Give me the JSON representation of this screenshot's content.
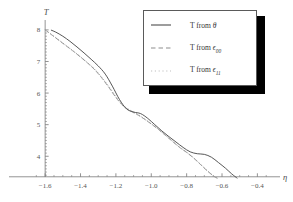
{
  "chart_data": {
    "type": "line",
    "title": "",
    "xlabel": "η",
    "ylabel": "T",
    "xlim": [
      -1.68,
      -0.34
    ],
    "ylim": [
      3.28,
      8.25
    ],
    "grid": false,
    "legend_position": "upper-right",
    "xticks": [
      -1.6,
      -1.4,
      -1.2,
      -1.0,
      -0.8,
      -0.6,
      -0.4
    ],
    "xtick_labels": [
      "-1.6",
      "-1.4",
      "-1.2",
      "-1.0",
      "-0.8",
      "-0.6",
      "-0.4"
    ],
    "yticks": [
      4,
      5,
      6,
      7,
      8
    ],
    "ytick_labels": [
      "4",
      "5",
      "6",
      "7",
      "8"
    ],
    "xtick_minor_step": 0.05,
    "ytick_minor_step": 0.1,
    "series": [
      {
        "name": "T from θ",
        "style": "solid",
        "color": "#4d4d4d",
        "x": [
          -1.565,
          -1.54,
          -1.5,
          -1.46,
          -1.42,
          -1.38,
          -1.34,
          -1.3,
          -1.26,
          -1.22,
          -1.18,
          -1.14,
          -1.1,
          -1.06,
          -1.02,
          -0.98,
          -0.94,
          -0.9,
          -0.86,
          -0.82,
          -0.78,
          -0.74,
          -0.7,
          -0.66,
          -0.62,
          -0.58,
          -0.545,
          -0.515
        ],
        "y": [
          7.99,
          7.93,
          7.8,
          7.64,
          7.46,
          7.27,
          7.07,
          6.86,
          6.6,
          6.22,
          5.8,
          5.5,
          5.4,
          5.35,
          5.2,
          5.0,
          4.8,
          4.62,
          4.45,
          4.28,
          4.14,
          4.08,
          4.06,
          3.97,
          3.8,
          3.62,
          3.44,
          3.31
        ]
      },
      {
        "name": "T from ε₀₀",
        "style": "dashed",
        "color": "#8e8e8e",
        "x": [
          -1.6,
          -1.56,
          -1.52,
          -1.48,
          -1.44,
          -1.4,
          -1.36,
          -1.32,
          -1.28,
          -1.24,
          -1.2,
          -1.16,
          -1.12,
          -1.08,
          -1.04,
          -1.0,
          -0.96,
          -0.92,
          -0.88,
          -0.84,
          -0.8,
          -0.76,
          -0.72,
          -0.68,
          -0.645,
          -0.625
        ],
        "y": [
          8.0,
          7.83,
          7.66,
          7.49,
          7.32,
          7.14,
          6.95,
          6.74,
          6.48,
          6.18,
          5.86,
          5.6,
          5.44,
          5.32,
          5.18,
          5.02,
          4.85,
          4.66,
          4.47,
          4.28,
          4.12,
          3.94,
          3.73,
          3.52,
          3.36,
          3.3
        ]
      },
      {
        "name": "T from ε₁₁",
        "style": "dotted",
        "color": "#b4b4b4",
        "x": [
          -1.6,
          -1.56,
          -1.52,
          -1.48,
          -1.44,
          -1.4,
          -1.36,
          -1.32,
          -1.28,
          -1.24,
          -1.2,
          -1.16,
          -1.12,
          -1.08,
          -1.04,
          -1.0,
          -0.96,
          -0.92,
          -0.88,
          -0.84,
          -0.8,
          -0.76,
          -0.72,
          -0.68,
          -0.645,
          -0.625
        ],
        "y": [
          8.0,
          7.84,
          7.67,
          7.5,
          7.33,
          7.15,
          6.96,
          6.76,
          6.5,
          6.21,
          5.89,
          5.62,
          5.46,
          5.34,
          5.19,
          5.03,
          4.86,
          4.67,
          4.48,
          4.29,
          4.13,
          3.95,
          3.74,
          3.53,
          3.37,
          3.31
        ]
      }
    ]
  },
  "axes": {
    "y_label": "T",
    "x_label": "η"
  },
  "legend": {
    "entries": [
      {
        "prefix": "T from ",
        "symbol": "θ",
        "subscript": "",
        "style": "solid"
      },
      {
        "prefix": "T from ",
        "symbol": "ϵ",
        "subscript": "00",
        "style": "dashed"
      },
      {
        "prefix": "T from ",
        "symbol": "ϵ",
        "subscript": "11",
        "style": "dotted"
      }
    ]
  },
  "colors": {
    "axis": "#777777",
    "solid_curve": "#4d4d4d",
    "dashed_curve": "#8e8e8e",
    "dotted_curve": "#b4b4b4",
    "legend_border": "#5a5a5a",
    "legend_shadow": "#000000",
    "background": "#ffffff"
  }
}
